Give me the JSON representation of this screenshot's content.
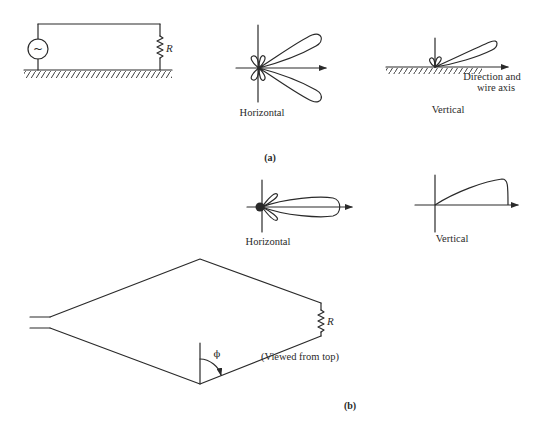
{
  "figure": {
    "part_a": {
      "caption": "(a)",
      "circuit": {
        "source_symbol": "~",
        "resistor_label": "R"
      },
      "horizontal_pattern": {
        "label": "Horizontal"
      },
      "vertical_pattern": {
        "label": "Vertical",
        "axis_label_line1": "Direction and",
        "axis_label_line2": "wire axis"
      }
    },
    "part_b": {
      "caption": "(b)",
      "horizontal_pattern": {
        "label": "Horizontal"
      },
      "vertical_pattern": {
        "label": "Vertical"
      },
      "rhombic_antenna": {
        "resistor_label": "R",
        "angle_label": "ϕ",
        "view_note": "(Viewed from top)"
      }
    }
  },
  "colors": {
    "ink": "#2a2a2a",
    "background": "#ffffff"
  }
}
